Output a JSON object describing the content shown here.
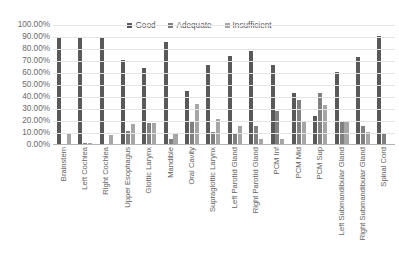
{
  "chart_data": {
    "type": "bar",
    "title": "",
    "subtitle": "",
    "xlabel": "",
    "ylabel": "",
    "ylim": [
      0,
      100
    ],
    "grid": true,
    "legend_position": "top-center",
    "y_unit": "%",
    "y_ticks": [
      "0.00%",
      "10.00%",
      "20.00%",
      "30.00%",
      "40.00%",
      "50.00%",
      "60.00%",
      "70.00%",
      "80.00%",
      "90.00%",
      "100.00%"
    ],
    "y_tick_values": [
      0,
      10,
      20,
      30,
      40,
      50,
      60,
      70,
      80,
      90,
      100
    ],
    "categories": [
      "Brainstem",
      "Left Cochlea",
      "Right Cochlea",
      "Upper Esophagus",
      "Glottic Larynx",
      "Mandible",
      "Oral Cavity",
      "Supraglottic Larynx",
      "Left Parotid Gland",
      "Right Parotid Gland",
      "PCM Inf",
      "PCM Mid",
      "PCM Sup",
      "Left Submandibular Gland",
      "Right Submandibular Gland",
      "Spinal Cord"
    ],
    "series": [
      {
        "name": "Good",
        "color": "#595959",
        "values": [
          90.0,
          90.0,
          90.0,
          70.5,
          64.0,
          85.5,
          45.0,
          66.5,
          74.5,
          78.5,
          66.5,
          43.5,
          24.0,
          60.5,
          73.0,
          90.5
        ]
      },
      {
        "name": "Adequate",
        "color": "#808080",
        "values": [
          0.0,
          2.0,
          0.0,
          12.0,
          18.0,
          5.0,
          20.0,
          11.0,
          10.0,
          16.0,
          28.5,
          37.5,
          43.0,
          20.0,
          15.5,
          9.5
        ]
      },
      {
        "name": "Insufficient",
        "color": "#a6a6a6",
        "values": [
          9.0,
          2.0,
          8.0,
          17.5,
          18.0,
          9.0,
          34.5,
          22.0,
          15.5,
          5.0,
          5.0,
          19.0,
          33.0,
          20.0,
          11.0,
          0.0
        ]
      }
    ]
  },
  "colors": {
    "background": "#ffffff",
    "gridline": "#e4e4e4",
    "axis": "#b4b4b4",
    "text": "#595959"
  }
}
